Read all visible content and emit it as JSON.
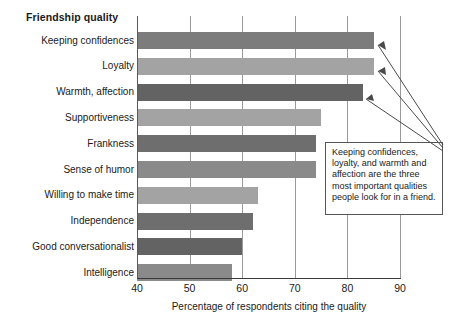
{
  "chart_data": {
    "type": "bar",
    "orientation": "horizontal",
    "title": "Friendship quality",
    "xlabel": "Percentage of respondents citing the quality",
    "ylabel": "",
    "xlim": [
      40,
      90
    ],
    "xticks": [
      40,
      50,
      60,
      70,
      80,
      90
    ],
    "grid": true,
    "legend": "none",
    "categories": [
      "Keeping confidences",
      "Loyalty",
      "Warmth, affection",
      "Supportiveness",
      "Frankness",
      "Sense of humor",
      "Willing to make time",
      "Independence",
      "Good conversationalist",
      "Intelligence"
    ],
    "values": [
      85,
      85,
      83,
      75,
      74,
      74,
      63,
      62,
      60,
      58
    ],
    "bar_colors": [
      "#7c7c7c",
      "#a3a3a3",
      "#636363",
      "#a3a3a3",
      "#6e6e6e",
      "#8a8a8a",
      "#a3a3a3",
      "#6e6e6e",
      "#636363",
      "#8a8a8a"
    ],
    "annotations": [
      {
        "text": "Keeping confidences, loyalty, and warmth and affection are the three most important qualities people look for in a friend.",
        "points_to": [
          "Keeping confidences",
          "Loyalty",
          "Warmth, affection"
        ]
      }
    ]
  },
  "colors": {
    "axis": "#3a3a3a",
    "gridline": "#9a9a9a",
    "text": "#1a1a1a",
    "annotation_border": "#555555",
    "background": "#ffffff"
  }
}
